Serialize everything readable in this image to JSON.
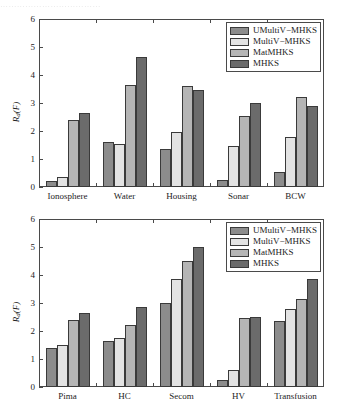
{
  "page": {
    "cropped_header_text": "………………………………"
  },
  "colors": {
    "series": [
      "#8c8c8c",
      "#e3e3e3",
      "#b5b5b5",
      "#6b6b6b"
    ],
    "axis": "#4a4a4a",
    "bar_edge": "#3a3a3a",
    "text": "#1c1c1c",
    "background": "#ffffff"
  },
  "legend": {
    "position": "upper-right",
    "entries": [
      {
        "label": "UMultiV−MHKS",
        "color": "#8c8c8c"
      },
      {
        "label": "MultiV−MHKS",
        "color": "#e3e3e3"
      },
      {
        "label": "MatMHKS",
        "color": "#b5b5b5"
      },
      {
        "label": "MHKS",
        "color": "#6b6b6b"
      }
    ]
  },
  "chart_data": [
    {
      "type": "bar",
      "title": "",
      "xlabel": "",
      "ylabel": "R_d(F)",
      "ylim": [
        0,
        6
      ],
      "yticks": [
        0,
        1,
        2,
        3,
        4,
        5,
        6
      ],
      "grid": false,
      "legend_position": "upper-right",
      "categories": [
        "Ionosphere",
        "Water",
        "Housing",
        "Sonar",
        "BCW"
      ],
      "series": [
        {
          "name": "UMultiV−MHKS",
          "values": [
            0.2,
            1.6,
            1.35,
            0.25,
            0.55
          ]
        },
        {
          "name": "MultiV−MHKS",
          "values": [
            0.35,
            1.55,
            1.95,
            1.45,
            1.8
          ]
        },
        {
          "name": "MatMHKS",
          "values": [
            2.4,
            3.65,
            3.6,
            2.55,
            3.2
          ]
        },
        {
          "name": "MHKS",
          "values": [
            2.65,
            4.65,
            3.45,
            3.0,
            2.9
          ]
        }
      ]
    },
    {
      "type": "bar",
      "title": "",
      "xlabel": "",
      "ylabel": "R_d(F)",
      "ylim": [
        0,
        6
      ],
      "yticks": [
        0,
        1,
        2,
        3,
        4,
        5,
        6
      ],
      "grid": false,
      "legend_position": "upper-right",
      "categories": [
        "Pima",
        "HC",
        "Secom",
        "HV",
        "Transfusion"
      ],
      "series": [
        {
          "name": "UMultiV−MHKS",
          "values": [
            1.4,
            1.65,
            3.0,
            0.25,
            2.35
          ]
        },
        {
          "name": "MultiV−MHKS",
          "values": [
            1.5,
            1.75,
            3.85,
            0.6,
            2.8
          ]
        },
        {
          "name": "MatMHKS",
          "values": [
            2.4,
            2.2,
            4.5,
            2.45,
            3.15
          ]
        },
        {
          "name": "MHKS",
          "values": [
            2.65,
            2.85,
            5.0,
            2.5,
            3.85
          ]
        }
      ]
    }
  ]
}
